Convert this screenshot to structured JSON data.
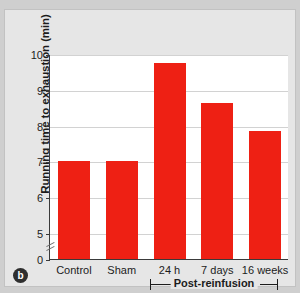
{
  "panel": {
    "label": "b"
  },
  "chart_data": {
    "type": "bar",
    "title": "",
    "xlabel": "",
    "ylabel": "Running time to exhaustion (min)",
    "categories": [
      "Control",
      "Sham",
      "24 h",
      "7 days",
      "16 weeks"
    ],
    "values": [
      7.0,
      7.0,
      9.75,
      8.62,
      7.85
    ],
    "ylim": [
      0,
      10
    ],
    "yticks": [
      0,
      5,
      6,
      7,
      8,
      9,
      10
    ],
    "ytick_labels": [
      "0",
      "5",
      "6",
      "7",
      "8",
      "9",
      "10"
    ],
    "axis_break": true,
    "axis_break_between": [
      0,
      5
    ],
    "grid": true,
    "grid_axis": "y",
    "legend": false,
    "bar_color": "#ee2014",
    "plot_background": "#ffffff",
    "figure_background": "#e6e6e6",
    "annotations": [
      {
        "text": "Post-reinfusion",
        "type": "group-bracket",
        "spans": [
          "24 h",
          "7 days",
          "16 weeks"
        ]
      }
    ]
  }
}
